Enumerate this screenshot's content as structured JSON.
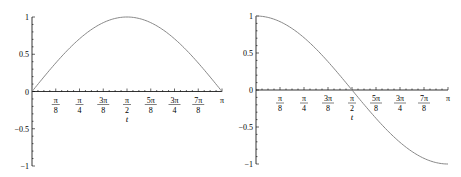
{
  "chart_data": [
    {
      "type": "line",
      "title": "",
      "function": "sin(t)",
      "xlabel": "t",
      "ylabel": "",
      "xlim": [
        0,
        3.14159
      ],
      "ylim": [
        -1,
        1
      ],
      "x_ticks": [
        {
          "value": 0.3927,
          "num": "π",
          "den": "8"
        },
        {
          "value": 0.7854,
          "num": "π",
          "den": "4"
        },
        {
          "value": 1.1781,
          "num": "3π",
          "den": "8"
        },
        {
          "value": 1.5708,
          "num": "π",
          "den": "2"
        },
        {
          "value": 1.9635,
          "num": "5π",
          "den": "8"
        },
        {
          "value": 2.3562,
          "num": "3π",
          "den": "4"
        },
        {
          "value": 2.7489,
          "num": "7π",
          "den": "8"
        },
        {
          "value": 3.1416,
          "num": "π",
          "den": ""
        }
      ],
      "y_ticks": [
        {
          "value": 1,
          "label": "1"
        },
        {
          "value": 0.5,
          "label": "0.5"
        },
        {
          "value": 0,
          "label": "0"
        },
        {
          "value": -0.5,
          "label": "-0.5"
        },
        {
          "value": -1,
          "label": "-1"
        }
      ],
      "series": [
        {
          "name": "sin(t)",
          "color": "#888888",
          "x": [
            0,
            0.3927,
            0.7854,
            1.1781,
            1.5708,
            1.9635,
            2.3562,
            2.7489,
            3.1416
          ],
          "y": [
            0,
            0.383,
            0.707,
            0.924,
            1,
            0.924,
            0.707,
            0.383,
            0
          ]
        }
      ],
      "grid": false,
      "legend": "none"
    },
    {
      "type": "line",
      "title": "",
      "function": "cos(t)",
      "xlabel": "t",
      "ylabel": "",
      "xlim": [
        0,
        3.14159
      ],
      "ylim": [
        -1,
        1
      ],
      "x_ticks": [
        {
          "value": 0.3927,
          "num": "π",
          "den": "8"
        },
        {
          "value": 0.7854,
          "num": "π",
          "den": "4"
        },
        {
          "value": 1.1781,
          "num": "3π",
          "den": "8"
        },
        {
          "value": 1.5708,
          "num": "π",
          "den": "2"
        },
        {
          "value": 1.9635,
          "num": "5π",
          "den": "8"
        },
        {
          "value": 2.3562,
          "num": "3π",
          "den": "4"
        },
        {
          "value": 2.7489,
          "num": "7π",
          "den": "8"
        },
        {
          "value": 3.1416,
          "num": "π",
          "den": ""
        }
      ],
      "y_ticks": [
        {
          "value": 1,
          "label": "1"
        },
        {
          "value": 0.5,
          "label": "0.5"
        },
        {
          "value": 0,
          "label": "0"
        },
        {
          "value": -0.5,
          "label": "-0.5"
        },
        {
          "value": -1,
          "label": "-1"
        }
      ],
      "series": [
        {
          "name": "cos(t)",
          "color": "#888888",
          "x": [
            0,
            0.3927,
            0.7854,
            1.1781,
            1.5708,
            1.9635,
            2.3562,
            2.7489,
            3.1416
          ],
          "y": [
            1,
            0.924,
            0.707,
            0.383,
            0,
            -0.383,
            -0.707,
            -0.924,
            -1
          ]
        }
      ],
      "grid": false,
      "legend": "none"
    }
  ]
}
